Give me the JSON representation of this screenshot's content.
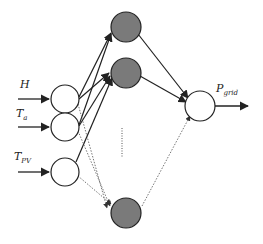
{
  "diagram": {
    "type": "neural-network",
    "colors": {
      "line": "#222222",
      "dotted": "#777777",
      "hidden_fill": "#7a7a7a",
      "node_fill": "#ffffff"
    },
    "inputs": [
      {
        "label": "H",
        "sub": ""
      },
      {
        "label": "T",
        "sub": "a"
      },
      {
        "label": "T",
        "sub": "PV"
      }
    ],
    "hidden_layer": {
      "count_visible": 3,
      "ellipsis": "⋮"
    },
    "output": {
      "label": "P",
      "sub": "grid"
    }
  }
}
